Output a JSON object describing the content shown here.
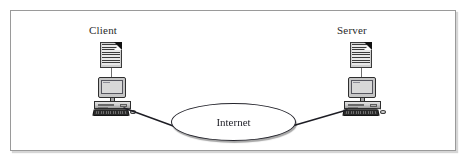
{
  "figure": {
    "border_color": "#9a9a9a",
    "background": "#ffffff"
  },
  "diagram": {
    "type": "network-diagram",
    "nodes": [
      {
        "id": "client",
        "label": "Client",
        "icon": "document-icon",
        "device": "desktop-computer-icon",
        "position": {
          "x": 92,
          "y": 38
        }
      },
      {
        "id": "internet",
        "label": "Internet",
        "shape": "ellipse",
        "position": {
          "x": 171,
          "y": 103
        },
        "size": {
          "width": 125,
          "height": 38
        }
      },
      {
        "id": "server",
        "label": "Server",
        "icon": "document-icon",
        "device": "desktop-computer-icon",
        "position": {
          "x": 342,
          "y": 38
        }
      }
    ],
    "links": [
      {
        "from": "client",
        "to": "internet"
      },
      {
        "from": "internet",
        "to": "server"
      }
    ],
    "colors": {
      "line": "#1d1d24",
      "device_body": "#c6c6c6",
      "screen": "#d8d8d8",
      "keyboard": "#2b2b2b",
      "document_fold": "#111111"
    }
  }
}
